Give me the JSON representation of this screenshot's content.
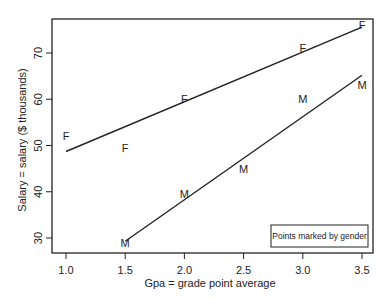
{
  "chart_data": {
    "type": "scatter",
    "title": "",
    "xlabel": "Gpa = grade point average",
    "ylabel": "Salary = salary ($ thousands)",
    "xlim": [
      0.93,
      3.59
    ],
    "ylim": [
      26.8,
      77.5
    ],
    "x_ticks": [
      "1.0",
      "1.5",
      "2.0",
      "2.5",
      "3.0",
      "3.5"
    ],
    "y_ticks": [
      "30",
      "40",
      "50",
      "60",
      "70"
    ],
    "grid": false,
    "legend": {
      "text": "Points marked by gender",
      "position": "bottom-right"
    },
    "series": [
      {
        "name": "F",
        "marker": "F",
        "points": [
          {
            "x": 1.0,
            "y": 52
          },
          {
            "x": 1.5,
            "y": 49.5
          },
          {
            "x": 2.0,
            "y": 60
          },
          {
            "x": 3.0,
            "y": 71
          },
          {
            "x": 3.5,
            "y": 76
          }
        ],
        "fit_line": {
          "x": [
            1.0,
            3.5
          ],
          "y": [
            48.7,
            75.6
          ]
        }
      },
      {
        "name": "M",
        "marker": "M",
        "points": [
          {
            "x": 1.5,
            "y": 29
          },
          {
            "x": 2.0,
            "y": 39.5
          },
          {
            "x": 2.5,
            "y": 45
          },
          {
            "x": 3.0,
            "y": 60
          },
          {
            "x": 3.5,
            "y": 63
          }
        ],
        "fit_line": {
          "x": [
            1.5,
            3.5
          ],
          "y": [
            29.3,
            65.2
          ]
        }
      }
    ]
  },
  "labels": {
    "xlabel": "Gpa = grade point average",
    "ylabel": "Salary = salary ($ thousands)",
    "legend": "Points marked by gender"
  }
}
